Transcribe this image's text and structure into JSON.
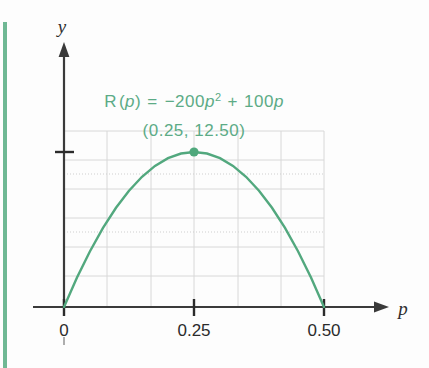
{
  "figure": {
    "accent_color": "#5cab86",
    "curve_color": "#52a87e",
    "axis_color": "#3a3a3a",
    "grid_color": "#d6d6d6",
    "equation": {
      "prefix": "R",
      "open": "(",
      "var": "p",
      "close": ")",
      "equals": "=",
      "term1_sign": "−",
      "term1_coeff": "200",
      "term1_var": "p",
      "term1_exp": "2",
      "plus": "+",
      "term2_coeff": "100",
      "term2_var": "p",
      "full": "R(p) = −200p² + 100p"
    },
    "point_label": "(0.25, 12.50)",
    "y_axis_label": "y",
    "x_axis_label": "p",
    "x_tick_labels": [
      "0",
      "0.25",
      "0.50"
    ]
  },
  "chart_data": {
    "type": "line",
    "xlabel": "p",
    "ylabel": "y",
    "xlim": [
      0,
      0.55
    ],
    "ylim": [
      0,
      14.5
    ],
    "grid": true,
    "legend": "none",
    "annotations": [
      {
        "text": "R(p) = −200p² + 100p",
        "x": 0.25,
        "y": 20.5
      },
      {
        "text": "(0.25, 12.50)",
        "x": 0.25,
        "y": 17.4
      }
    ],
    "markers": [
      {
        "label": "vertex",
        "x": 0.25,
        "y": 12.5
      }
    ],
    "xticks": [
      0,
      0.25,
      0.5
    ],
    "xtick_labels": [
      "0",
      "0.25",
      "0.50"
    ],
    "yticks": [
      12.5
    ],
    "ytick_labels": [
      ""
    ],
    "series": [
      {
        "name": "R(p)",
        "equation": "R(p) = -200p^2 + 100p",
        "x": [
          0.0,
          0.025,
          0.05,
          0.075,
          0.1,
          0.125,
          0.15,
          0.175,
          0.2,
          0.225,
          0.25,
          0.275,
          0.3,
          0.325,
          0.35,
          0.375,
          0.4,
          0.425,
          0.45,
          0.475,
          0.5
        ],
        "values": [
          0.0,
          2.375,
          4.5,
          6.375,
          8.0,
          9.375,
          10.5,
          11.375,
          12.0,
          12.375,
          12.5,
          12.375,
          12.0,
          11.375,
          10.5,
          9.375,
          8.0,
          6.375,
          4.5,
          2.375,
          0.0
        ]
      }
    ]
  }
}
